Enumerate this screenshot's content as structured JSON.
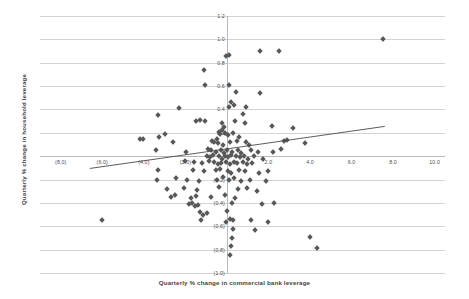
{
  "chart_data": {
    "type": "scatter",
    "title": "",
    "xlabel": "Quarterly % change in commercial bank leverage",
    "ylabel": "Quarterly % change in household leverage",
    "xlim": [
      -9.0,
      10.5
    ],
    "ylim": [
      -1.0,
      1.2
    ],
    "grid": true,
    "legend": null,
    "xticks": [
      -8,
      -6,
      -4,
      -2,
      2,
      4,
      6,
      8,
      10
    ],
    "xticklabels": [
      "(8.0)",
      "(6.0)",
      "(4.0)",
      "(2.0)",
      "2.0",
      "4.0",
      "6.0",
      "8.0",
      "10.0"
    ],
    "yticks": [
      1.2,
      1.0,
      0.8,
      0.6,
      0.4,
      0.2,
      -0.2,
      -0.4,
      -0.6,
      -0.8,
      -1.0
    ],
    "yticklabels": [
      "1.2",
      "1.0",
      "0.8",
      "0.6",
      "0.4",
      "0.2",
      "(0.2)",
      "(0.4)",
      "(0.6)",
      "(0.8)",
      "(1.0)"
    ],
    "marker": "diamond",
    "marker_color": "#58585a",
    "trendline": {
      "type": "linear",
      "color": "#4a4a4a",
      "x0": -6.6,
      "y0": -0.105,
      "x1": 7.6,
      "y1": 0.255
    },
    "points": [
      [
        7.5,
        1.0
      ],
      [
        -0.05,
        0.86
      ],
      [
        0.12,
        0.87
      ],
      [
        1.6,
        0.9
      ],
      [
        2.5,
        0.9
      ],
      [
        -1.1,
        0.74
      ],
      [
        -1.05,
        0.61
      ],
      [
        0.1,
        0.61
      ],
      [
        1.6,
        0.54
      ],
      [
        0.45,
        0.55
      ],
      [
        -2.3,
        0.41
      ],
      [
        0.1,
        0.42
      ],
      [
        0.35,
        0.44
      ],
      [
        0.9,
        0.42
      ],
      [
        0.2,
        0.46
      ],
      [
        0.75,
        0.36
      ],
      [
        -3.3,
        0.35
      ],
      [
        -1.5,
        0.3
      ],
      [
        -1.3,
        0.31
      ],
      [
        -1.05,
        0.3
      ],
      [
        -0.25,
        0.28
      ],
      [
        -0.15,
        0.25
      ],
      [
        0.4,
        0.3
      ],
      [
        0.85,
        0.28
      ],
      [
        2.15,
        0.26
      ],
      [
        3.2,
        0.24
      ],
      [
        -3.0,
        0.19
      ],
      [
        -0.4,
        0.21
      ],
      [
        -0.35,
        0.19
      ],
      [
        -0.25,
        0.22
      ],
      [
        -0.1,
        0.2
      ],
      [
        0.3,
        0.2
      ],
      [
        0.05,
        0.18
      ],
      [
        0.6,
        0.16
      ],
      [
        -4.2,
        0.15
      ],
      [
        -4.05,
        0.15
      ],
      [
        -3.25,
        0.16
      ],
      [
        -2.6,
        0.12
      ],
      [
        -0.7,
        0.13
      ],
      [
        -0.6,
        0.12
      ],
      [
        -0.5,
        0.15
      ],
      [
        -0.45,
        0.11
      ],
      [
        -0.2,
        0.1
      ],
      [
        0.15,
        0.12
      ],
      [
        0.5,
        0.13
      ],
      [
        0.9,
        0.12
      ],
      [
        1.05,
        0.1
      ],
      [
        2.75,
        0.13
      ],
      [
        2.9,
        0.14
      ],
      [
        3.75,
        0.11
      ],
      [
        -3.4,
        0.05
      ],
      [
        -1.95,
        0.04
      ],
      [
        -0.9,
        0.06
      ],
      [
        -0.75,
        0.05
      ],
      [
        -0.55,
        0.04
      ],
      [
        -0.3,
        0.05
      ],
      [
        -0.15,
        0.03
      ],
      [
        0.0,
        0.05
      ],
      [
        0.25,
        0.04
      ],
      [
        0.55,
        0.05
      ],
      [
        0.7,
        0.03
      ],
      [
        1.15,
        0.05
      ],
      [
        1.5,
        0.04
      ],
      [
        2.2,
        0.04
      ],
      [
        2.6,
        0.06
      ],
      [
        -0.95,
        0.0
      ],
      [
        -0.8,
        -0.01
      ],
      [
        -0.65,
        0.01
      ],
      [
        -0.4,
        0.0
      ],
      [
        -0.25,
        -0.02
      ],
      [
        -0.1,
        0.0
      ],
      [
        0.05,
        -0.01
      ],
      [
        0.2,
        0.01
      ],
      [
        0.45,
        0.0
      ],
      [
        0.65,
        -0.01
      ],
      [
        0.8,
        0.0
      ],
      [
        1.0,
        -0.02
      ],
      [
        1.3,
        0.0
      ],
      [
        1.75,
        -0.02
      ],
      [
        -2.0,
        -0.04
      ],
      [
        -1.6,
        -0.05
      ],
      [
        -1.2,
        -0.06
      ],
      [
        -0.85,
        -0.04
      ],
      [
        -0.6,
        -0.05
      ],
      [
        -0.45,
        -0.07
      ],
      [
        -0.3,
        -0.06
      ],
      [
        -0.05,
        -0.05
      ],
      [
        0.15,
        -0.07
      ],
      [
        0.35,
        -0.05
      ],
      [
        0.5,
        -0.06
      ],
      [
        0.75,
        -0.05
      ],
      [
        0.95,
        -0.07
      ],
      [
        1.2,
        -0.06
      ],
      [
        -3.3,
        -0.12
      ],
      [
        -1.65,
        -0.12
      ],
      [
        -1.1,
        -0.13
      ],
      [
        -0.55,
        -0.12
      ],
      [
        -0.35,
        -0.11
      ],
      [
        0.05,
        -0.13
      ],
      [
        0.2,
        -0.14
      ],
      [
        0.6,
        -0.12
      ],
      [
        0.85,
        -0.13
      ],
      [
        1.55,
        -0.14
      ],
      [
        2.0,
        -0.13
      ],
      [
        -3.35,
        -0.2
      ],
      [
        -2.45,
        -0.19
      ],
      [
        -1.9,
        -0.2
      ],
      [
        -1.35,
        -0.21
      ],
      [
        -0.5,
        -0.2
      ],
      [
        -0.2,
        -0.18
      ],
      [
        0.1,
        -0.2
      ],
      [
        0.35,
        -0.19
      ],
      [
        0.7,
        -0.21
      ],
      [
        1.1,
        -0.2
      ],
      [
        1.9,
        -0.21
      ],
      [
        -2.9,
        -0.28
      ],
      [
        -2.05,
        -0.27
      ],
      [
        -1.45,
        -0.29
      ],
      [
        -0.4,
        -0.26
      ],
      [
        0.55,
        -0.28
      ],
      [
        0.95,
        -0.27
      ],
      [
        1.45,
        -0.3
      ],
      [
        -2.7,
        -0.35
      ],
      [
        -2.5,
        -0.33
      ],
      [
        -1.75,
        -0.36
      ],
      [
        -1.5,
        -0.34
      ],
      [
        -0.75,
        -0.35
      ],
      [
        -0.1,
        -0.33
      ],
      [
        0.4,
        -0.36
      ],
      [
        -1.85,
        -0.41
      ],
      [
        -1.7,
        -0.4
      ],
      [
        -1.55,
        -0.43
      ],
      [
        -1.4,
        -0.42
      ],
      [
        0.25,
        -0.4
      ],
      [
        1.7,
        -0.41
      ],
      [
        2.25,
        -0.4
      ],
      [
        -1.3,
        -0.48
      ],
      [
        -1.15,
        -0.5
      ],
      [
        -0.95,
        -0.49
      ],
      [
        0.0,
        -0.47
      ],
      [
        -6.0,
        -0.55
      ],
      [
        -1.25,
        -0.55
      ],
      [
        0.15,
        -0.54
      ],
      [
        0.3,
        -0.55
      ],
      [
        -0.05,
        -0.56
      ],
      [
        1.15,
        -0.55
      ],
      [
        2.0,
        -0.56
      ],
      [
        0.3,
        -0.62
      ],
      [
        1.35,
        -0.63
      ],
      [
        0.25,
        -0.7
      ],
      [
        4.0,
        -0.69
      ],
      [
        0.2,
        -0.77
      ],
      [
        4.35,
        -0.79
      ],
      [
        0.15,
        -0.85
      ]
    ]
  },
  "axes": {
    "x_title": "Quarterly % change in commercial bank leverage",
    "y_title": "Quarterly % change in household leverage"
  }
}
